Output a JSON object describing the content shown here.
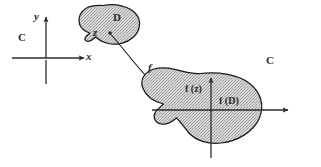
{
  "figure": {
    "domain_plane": {
      "plane_label": "C",
      "y_axis_label": "y",
      "x_axis_label": "x",
      "set_label": "D",
      "point_label": "z"
    },
    "mapping": {
      "function_label": "f"
    },
    "codomain_plane": {
      "plane_label": "C",
      "image_point_label": "f (z)",
      "image_set_label": "f (D)"
    },
    "colors": {
      "ink": "#2b2b2b",
      "blob_fill": "#c9c9c9",
      "blob_stroke": "#1a1a1a",
      "background": "#ffffff"
    }
  }
}
